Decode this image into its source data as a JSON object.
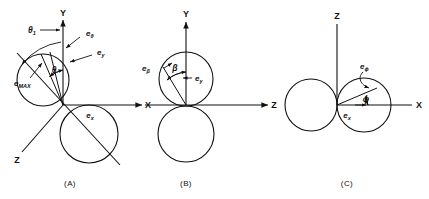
{
  "figure": {
    "type": "vector-field-lobe-diagram",
    "stroke_color": "#111111",
    "background": "#ffffff",
    "width": 429,
    "height": 199
  },
  "panels": [
    {
      "id": "A",
      "caption": "(A)",
      "axes": [
        {
          "name": "Y",
          "label": "Y",
          "direction": "up"
        },
        {
          "name": "X",
          "label": "X",
          "direction": "right"
        },
        {
          "name": "Z",
          "label": "Z",
          "direction": "lower-left"
        }
      ],
      "angles": [
        {
          "label": "θ₁",
          "name": "theta-1"
        },
        {
          "label": "θ",
          "name": "theta"
        }
      ],
      "vectors": [
        {
          "base": "e",
          "sub": "θ",
          "name": "e-theta"
        },
        {
          "base": "e",
          "sub": "y",
          "name": "e-y"
        },
        {
          "base": "e",
          "sub": "MAX",
          "name": "e-max"
        },
        {
          "base": "e",
          "sub": "x",
          "name": "e-x"
        }
      ]
    },
    {
      "id": "B",
      "caption": "(B)",
      "axes": [
        {
          "name": "Y",
          "label": "Y",
          "direction": "up"
        },
        {
          "name": "Z",
          "label": "Z",
          "direction": "right"
        },
        {
          "name": "X",
          "label": "X",
          "direction": "left"
        }
      ],
      "angles": [
        {
          "label": "β",
          "name": "beta"
        }
      ],
      "vectors": [
        {
          "base": "e",
          "sub": "β",
          "name": "e-beta"
        },
        {
          "base": "e",
          "sub": "y",
          "name": "e-y"
        }
      ]
    },
    {
      "id": "C",
      "caption": "(C)",
      "axes": [
        {
          "name": "Z",
          "label": "Z",
          "direction": "up"
        },
        {
          "name": "X",
          "label": "X",
          "direction": "right"
        }
      ],
      "angles": [
        {
          "label": "ϕ",
          "name": "phi"
        }
      ],
      "vectors": [
        {
          "base": "e",
          "sub": "ϕ",
          "name": "e-phi"
        },
        {
          "base": "e",
          "sub": "x",
          "name": "e-x"
        }
      ]
    }
  ],
  "labels": {
    "axis_Y": "Y",
    "axis_X": "X",
    "axis_Z": "Z",
    "e": "e",
    "sub_theta": "θ",
    "sub_y": "y",
    "sub_x": "x",
    "sub_MAX": "MAX",
    "sub_beta": "β",
    "sub_phi": "ϕ",
    "theta1": "θ",
    "theta1_sub": "1",
    "theta": "θ",
    "beta": "β",
    "phi": "ϕ",
    "caption_a": "(A)",
    "caption_b": "(B)",
    "caption_c": "(C)"
  }
}
